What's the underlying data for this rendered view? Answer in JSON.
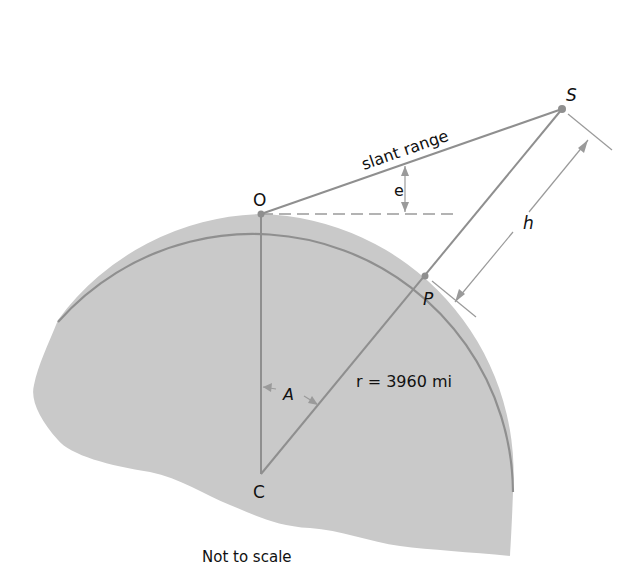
{
  "diagram": {
    "colors": {
      "earth_fill": "#c9c9c9",
      "earth_outline": "#8f8f8f",
      "line": "#8f8f8f",
      "dim_line": "#9a9a9a",
      "text": "#111111"
    },
    "points": {
      "O": {
        "label": "O",
        "x": 261,
        "y": 214
      },
      "S": {
        "label": "S",
        "x": 562,
        "y": 109
      },
      "P": {
        "label": "P",
        "x": 425,
        "y": 276
      },
      "C": {
        "label": "C",
        "x": 261,
        "y": 474
      }
    },
    "labels": {
      "slant_range": "slant range",
      "elevation_angle": "e",
      "height": "h",
      "central_angle": "A",
      "radius": "r = 3960 mi",
      "note": "Not to scale"
    }
  }
}
